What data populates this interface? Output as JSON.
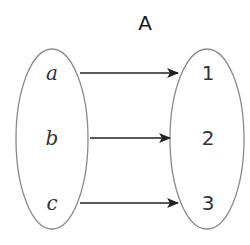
{
  "diagram": {
    "title": "A",
    "type": "function-mapping",
    "domain_set": {
      "elements": [
        "a",
        "b",
        "c"
      ]
    },
    "codomain_set": {
      "elements": [
        "1",
        "2",
        "3"
      ]
    },
    "mappings": [
      {
        "from": "a",
        "to": "1"
      },
      {
        "from": "b",
        "to": "2"
      },
      {
        "from": "c",
        "to": "3"
      }
    ],
    "colors": {
      "stroke": "#888888",
      "arrow": "#222222",
      "text": "#333333"
    }
  }
}
